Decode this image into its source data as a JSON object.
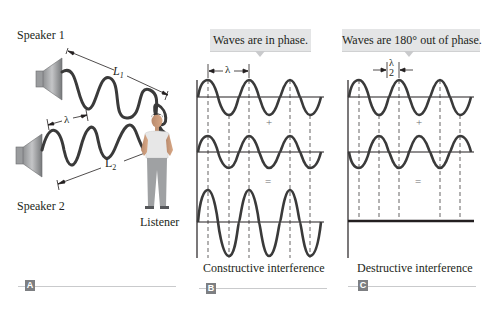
{
  "panel_a": {
    "tag": "A",
    "speaker1_label": "Speaker 1",
    "speaker2_label": "Speaker 2",
    "listener_label": "Listener",
    "L1_label": "L",
    "L1_sub": "1",
    "L2_label": "L",
    "L2_sub": "2",
    "lambda_label": "λ"
  },
  "panel_b": {
    "tag": "B",
    "callout": "Waves are in phase.",
    "lambda_label": "λ",
    "plus": "+",
    "equals": "=",
    "caption": "Constructive interference"
  },
  "panel_c": {
    "tag": "C",
    "callout": "Waves are 180° out of phase.",
    "lambda_num": "λ",
    "lambda_den": "2",
    "plus": "+",
    "equals": "=",
    "caption": "Destructive interference"
  },
  "colors": {
    "wave": "#3a3a3a",
    "axis": "#231f20",
    "callout_bg": "#e4e5e6",
    "tag_bg": "#7d7f82",
    "rule": "#c9cacc"
  }
}
